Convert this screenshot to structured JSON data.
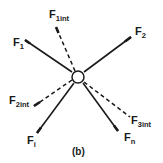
{
  "diagram": {
    "caption": "(b)",
    "node": {
      "shape": "circle",
      "center": [
        78,
        77
      ],
      "radius": 6
    },
    "colors": {
      "line": "#1a1a1a",
      "background": "#ffffff"
    },
    "forces": [
      {
        "id": "F1",
        "main": "F",
        "sub": "1",
        "style": "solid",
        "from": [
          72,
          72
        ],
        "to": [
          25,
          40
        ],
        "label_pos": [
          13,
          46
        ]
      },
      {
        "id": "F1int",
        "main": "F",
        "sub": "1int",
        "style": "dashed",
        "from": [
          75,
          71
        ],
        "to": [
          56,
          27
        ],
        "label_pos": [
          49,
          18
        ]
      },
      {
        "id": "F2",
        "main": "F",
        "sub": "2",
        "style": "solid",
        "from": [
          84,
          72
        ],
        "to": [
          131,
          37
        ],
        "label_pos": [
          135,
          35
        ]
      },
      {
        "id": "F2int",
        "main": "F",
        "sub": "2int",
        "style": "dashed",
        "from": [
          72,
          80
        ],
        "to": [
          34,
          106
        ],
        "label_pos": [
          9,
          104
        ]
      },
      {
        "id": "Fi",
        "main": "F",
        "sub": "i",
        "style": "solid",
        "from": [
          74,
          83
        ],
        "to": [
          37,
          133
        ],
        "label_pos": [
          27,
          144
        ]
      },
      {
        "id": "Fn",
        "main": "F",
        "sub": "n",
        "style": "solid",
        "from": [
          83,
          83
        ],
        "to": [
          118,
          131
        ],
        "label_pos": [
          124,
          141
        ]
      },
      {
        "id": "F3int",
        "main": "F",
        "sub": "3int",
        "style": "dashed",
        "from": [
          84,
          82
        ],
        "to": [
          130,
          117
        ],
        "label_pos": [
          131,
          124
        ]
      }
    ]
  }
}
